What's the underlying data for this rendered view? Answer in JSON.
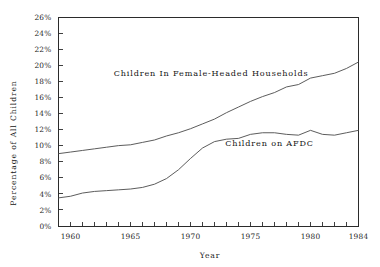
{
  "chart_data": {
    "type": "line",
    "title": "",
    "xlabel": "Year",
    "ylabel": "Percentage of All Children",
    "xlim": [
      1959,
      1984
    ],
    "ylim": [
      0,
      26
    ],
    "grid": false,
    "legend_position": "inline-annotations",
    "y_tick_labels": [
      "0%",
      "2%",
      "4%",
      "6%",
      "8%",
      "10%",
      "12%",
      "14%",
      "16%",
      "18%",
      "20%",
      "22%",
      "24%",
      "26%"
    ],
    "y_tick_values": [
      0,
      2,
      4,
      6,
      8,
      10,
      12,
      14,
      16,
      18,
      20,
      22,
      24,
      26
    ],
    "x_tick_labels": [
      "1960",
      "1965",
      "1970",
      "1975",
      "1980",
      "1984"
    ],
    "x_tick_values": [
      1960,
      1965,
      1970,
      1975,
      1980,
      1984
    ],
    "x_minor_ticks": [
      1959,
      1961,
      1962,
      1963,
      1964,
      1966,
      1967,
      1968,
      1969,
      1971,
      1972,
      1973,
      1974,
      1976,
      1977,
      1978,
      1979,
      1981,
      1982,
      1983
    ],
    "x": [
      1959,
      1960,
      1961,
      1962,
      1963,
      1964,
      1965,
      1966,
      1967,
      1968,
      1969,
      1970,
      1971,
      1972,
      1973,
      1974,
      1975,
      1976,
      1977,
      1978,
      1979,
      1980,
      1981,
      1982,
      1983,
      1984
    ],
    "series": [
      {
        "name": "Children In Female-Headed Households",
        "label": "Children In Female-Headed Households",
        "color": "#4a4a4a",
        "values": [
          9.0,
          9.2,
          9.4,
          9.6,
          9.8,
          10.0,
          10.1,
          10.4,
          10.7,
          11.2,
          11.6,
          12.1,
          12.7,
          13.3,
          14.1,
          14.8,
          15.5,
          16.1,
          16.6,
          17.3,
          17.6,
          18.4,
          18.7,
          19.0,
          19.6,
          20.4
        ]
      },
      {
        "name": "Children on AFDC",
        "label": "Children on AFDC",
        "color": "#4a4a4a",
        "values": [
          3.5,
          3.7,
          4.1,
          4.3,
          4.4,
          4.5,
          4.6,
          4.8,
          5.2,
          5.9,
          7.0,
          8.4,
          9.7,
          10.5,
          10.8,
          10.9,
          11.4,
          11.6,
          11.6,
          11.4,
          11.3,
          11.9,
          11.4,
          11.3,
          11.6,
          11.9
        ]
      }
    ],
    "annotations": [
      {
        "text": "Children In Female-Headed Households",
        "x": 1963.6,
        "y": 18.7,
        "name": "annotation-female-headed"
      },
      {
        "text": "Children on AFDC",
        "x": 1972.9,
        "y": 10.0,
        "name": "annotation-afdc"
      }
    ]
  }
}
